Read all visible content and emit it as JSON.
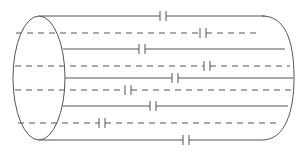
{
  "diagram": {
    "type": "cylindrical-capacitor-network",
    "colors": {
      "stroke": "#555555",
      "background": "#ffffff"
    },
    "cylinder": {
      "left_ellipse": {
        "cx": 39,
        "cy": 78,
        "rx": 26,
        "ry": 62
      },
      "top_y": 16,
      "bottom_y": 140,
      "right_cap_x": 270
    },
    "wires": [
      {
        "y": 16,
        "style": "solid",
        "x_start": 39,
        "x_end": 265,
        "capacitor_x": 163
      },
      {
        "y": 33,
        "style": "dashed",
        "x_start": 16,
        "x_end": 256,
        "capacitor_x": 203
      },
      {
        "y": 49,
        "style": "solid",
        "x_start": 63,
        "x_end": 285,
        "capacitor_x": 142
      },
      {
        "y": 66,
        "style": "dashed",
        "x_start": 15,
        "x_end": 290,
        "capacitor_x": 207
      },
      {
        "y": 78,
        "style": "solid",
        "x_start": 65,
        "x_end": 293,
        "capacitor_x": 175
      },
      {
        "y": 90,
        "style": "dashed",
        "x_start": 15,
        "x_end": 293,
        "capacitor_x": 128
      },
      {
        "y": 106,
        "style": "solid",
        "x_start": 63,
        "x_end": 288,
        "capacitor_x": 153
      },
      {
        "y": 123,
        "style": "dashed",
        "x_start": 18,
        "x_end": 280,
        "capacitor_x": 102
      },
      {
        "y": 140,
        "style": "solid",
        "x_start": 39,
        "x_end": 262,
        "capacitor_x": 186
      }
    ]
  }
}
